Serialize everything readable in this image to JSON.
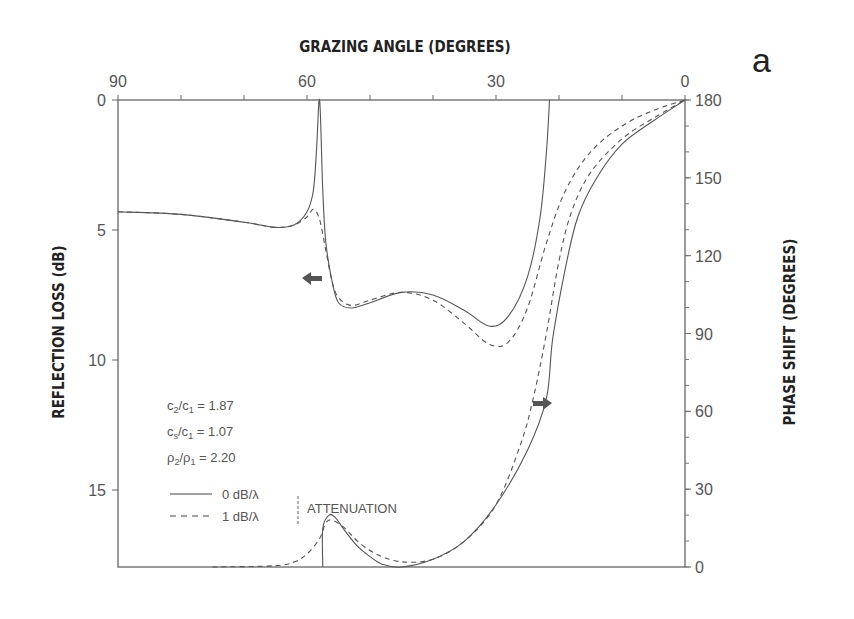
{
  "panel_label": "a",
  "chart_data": {
    "type": "line",
    "title": "",
    "xlabel": "GRAZING ANGLE (DEGREES)",
    "ylabel_left": "REFLECTION LOSS (dB)",
    "ylabel_right": "PHASE SHIFT (DEGREES)",
    "x_ticks": [
      "90",
      "60",
      "30",
      "0"
    ],
    "x_range": [
      90,
      0
    ],
    "y_left_ticks": [
      "0",
      "5",
      "10",
      "15"
    ],
    "y_left_range": [
      0,
      18
    ],
    "y_left_inverted": true,
    "y_right_ticks": [
      "180",
      "150",
      "120",
      "90",
      "60",
      "30",
      "0"
    ],
    "y_right_range": [
      0,
      180
    ],
    "grid": false,
    "parameters": [
      {
        "label": "c2/c1",
        "value": "1.87"
      },
      {
        "label": "cs/c1",
        "value": "1.07"
      },
      {
        "label": "ρ2/ρ1",
        "value": "2.20"
      }
    ],
    "legend": {
      "group_label": "ATTENUATION",
      "entries": [
        {
          "style": "solid",
          "label": "0 dB/λ"
        },
        {
          "style": "dashed",
          "label": "1 dB/λ"
        }
      ]
    },
    "annotations": [
      {
        "type": "arrow-left",
        "meaning": "reflection loss curves refer to left axis"
      },
      {
        "type": "arrow-right",
        "meaning": "phase shift curves refer to right axis"
      }
    ],
    "series": [
      {
        "name": "Reflection loss, 0 dB/λ",
        "axis": "left",
        "style": "solid",
        "x": [
          90,
          80,
          70,
          65,
          62,
          60,
          59,
          58.5,
          58,
          57.5,
          57,
          56,
          55,
          53,
          50,
          45,
          40,
          35,
          31,
          28,
          25,
          23,
          22,
          21.5
        ],
        "y": [
          4.3,
          4.4,
          4.7,
          4.9,
          4.8,
          4.3,
          3.5,
          2.0,
          0.0,
          3.5,
          5.5,
          7.0,
          7.8,
          8.0,
          7.8,
          7.4,
          7.5,
          8.1,
          8.7,
          8.3,
          6.8,
          4.5,
          2.0,
          0.0
        ]
      },
      {
        "name": "Reflection loss, 1 dB/λ",
        "axis": "left",
        "style": "dashed",
        "x": [
          90,
          80,
          70,
          65,
          62,
          60,
          59,
          58,
          57,
          56,
          55,
          53,
          50,
          45,
          40,
          35,
          31,
          28,
          25,
          22,
          19,
          15,
          10,
          5,
          0
        ],
        "y": [
          4.3,
          4.4,
          4.7,
          4.9,
          4.8,
          4.5,
          4.2,
          4.6,
          5.8,
          7.0,
          7.6,
          7.9,
          7.7,
          7.4,
          7.7,
          8.6,
          9.4,
          9.3,
          8.0,
          5.5,
          3.5,
          2.0,
          1.0,
          0.4,
          0.0
        ]
      },
      {
        "name": "Phase shift, 0 dB/λ",
        "axis": "right",
        "style": "solid",
        "x": [
          57.5,
          57.5,
          56.5,
          55.5,
          54,
          52,
          50,
          48,
          45,
          40,
          35,
          30,
          25,
          22,
          21,
          19,
          17,
          14,
          10,
          5,
          0
        ],
        "y": [
          0,
          15,
          20,
          19,
          14,
          8,
          4,
          1,
          0,
          3,
          10,
          24,
          45,
          65,
          88,
          115,
          135,
          150,
          163,
          172,
          180
        ]
      },
      {
        "name": "Phase shift, 1 dB/λ",
        "axis": "right",
        "style": "dashed",
        "x": [
          75,
          65,
          62,
          60,
          58,
          57,
          56,
          54,
          52,
          49,
          45,
          40,
          35,
          30,
          26,
          24,
          22,
          20,
          18,
          15,
          10,
          5,
          0
        ],
        "y": [
          0,
          0.5,
          2,
          5,
          11,
          17,
          18,
          15,
          10,
          5,
          2,
          3,
          10,
          24,
          48,
          66,
          90,
          118,
          137,
          152,
          165,
          173,
          180
        ]
      }
    ]
  }
}
